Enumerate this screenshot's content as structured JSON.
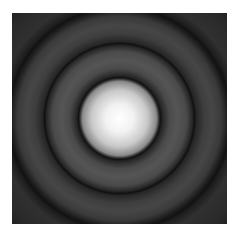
{
  "image": {
    "subject": "Airy disk diffraction pattern",
    "description": "Bright central disk surrounded by concentric dark and gray rings on a dark square",
    "colors": {
      "background": "#ffffff",
      "center": "#ffffff",
      "dark_ring": "#121212",
      "gray_ring": "#555555",
      "outer": "#1c1c1c"
    }
  }
}
